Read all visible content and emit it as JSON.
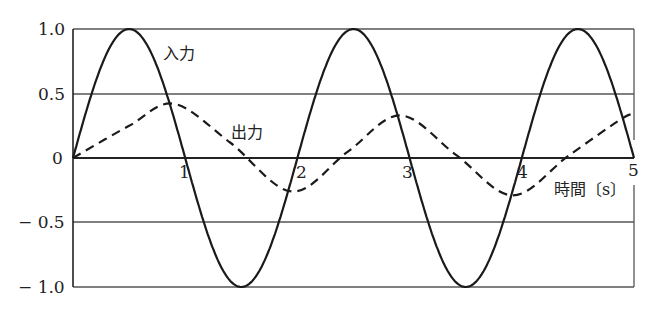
{
  "chart_data": {
    "type": "line",
    "title": "",
    "xlabel": "時間〔s〕",
    "ylabel": "",
    "xlim": [
      0,
      5
    ],
    "ylim": [
      -1.0,
      1.0
    ],
    "x_ticks": [
      "1",
      "2",
      "3",
      "4",
      "5"
    ],
    "y_ticks": [
      "1.0",
      "0.5",
      "0",
      "− 0.5",
      "− 1.0"
    ],
    "grid": "horizontal at 1.0, 0.5, -0.5, -1.0",
    "series": [
      {
        "name": "入力",
        "style": "solid",
        "description": "sin(pi*t), amplitude 1.0, period 2 s",
        "x": [
          0,
          0.5,
          1,
          1.5,
          2,
          2.5,
          3,
          3.5,
          4,
          4.5,
          5
        ],
        "values": [
          0,
          1.0,
          0,
          -1.0,
          0,
          1.0,
          0,
          -1.0,
          0,
          1.0,
          0
        ]
      },
      {
        "name": "出力",
        "style": "dashed",
        "description": "lagged response, transient then ~0.3 amplitude",
        "x": [
          0,
          0.5,
          0.9,
          1.4,
          1.95,
          2.45,
          2.92,
          3.42,
          3.92,
          4.42,
          4.92,
          5
        ],
        "values": [
          0,
          0.25,
          0.42,
          0.12,
          -0.26,
          0.05,
          0.33,
          0.02,
          -0.29,
          0.02,
          0.32,
          0.31
        ]
      }
    ],
    "annotations": [
      {
        "text": "入力"
      },
      {
        "text": "出力"
      }
    ]
  },
  "labels": {
    "y1": "1.0",
    "y05": "0.5",
    "y0": "0",
    "yn05": "− 0.5",
    "yn1": "− 1.0",
    "x1": "1",
    "x2": "2",
    "x3": "3",
    "x4": "4",
    "x5": "5",
    "xlabel": "時間〔s〕",
    "input": "入力",
    "output": "出力"
  }
}
